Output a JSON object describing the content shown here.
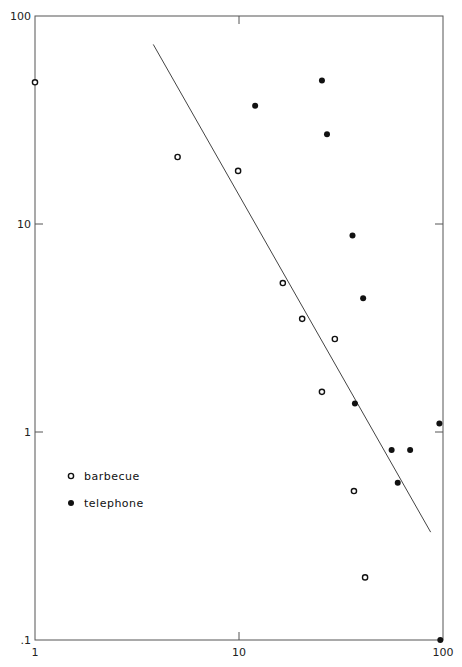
{
  "chart_data": {
    "type": "scatter",
    "title": "",
    "xlabel": "",
    "ylabel": "",
    "xscale": "log",
    "yscale": "log",
    "xlim": [
      1,
      100
    ],
    "ylim": [
      0.1,
      100
    ],
    "grid": false,
    "legend_position": "lower-left",
    "x_ticks": [
      "1",
      "10",
      "100"
    ],
    "y_ticks": [
      "100",
      "10",
      "1",
      ".1"
    ],
    "series": [
      {
        "name": "barbecue",
        "marker": "open-circle",
        "points": [
          {
            "x": 1,
            "y": 48
          },
          {
            "x": 5.0,
            "y": 21
          },
          {
            "x": 9.9,
            "y": 18
          },
          {
            "x": 16.4,
            "y": 5.2
          },
          {
            "x": 20.4,
            "y": 3.5
          },
          {
            "x": 29.5,
            "y": 2.8
          },
          {
            "x": 25.5,
            "y": 1.56
          },
          {
            "x": 36.6,
            "y": 0.52
          },
          {
            "x": 41.5,
            "y": 0.2
          }
        ]
      },
      {
        "name": "telephone",
        "marker": "filled-circle",
        "points": [
          {
            "x": 12,
            "y": 37
          },
          {
            "x": 25.5,
            "y": 49
          },
          {
            "x": 27,
            "y": 27
          },
          {
            "x": 36,
            "y": 8.8
          },
          {
            "x": 40.6,
            "y": 4.4
          },
          {
            "x": 37,
            "y": 1.37
          },
          {
            "x": 56,
            "y": 0.82
          },
          {
            "x": 69,
            "y": 0.82
          },
          {
            "x": 60,
            "y": 0.57
          },
          {
            "x": 96,
            "y": 1.1
          },
          {
            "x": 97,
            "y": 0.1
          }
        ]
      }
    ],
    "fit_line": {
      "x1": 3.8,
      "y1": 73,
      "x2": 87,
      "y2": 0.33
    },
    "legend": [
      {
        "label": "barbecue",
        "marker": "open-circle"
      },
      {
        "label": "telephone",
        "marker": "filled-circle"
      }
    ]
  },
  "axis": {
    "x_labels": [
      {
        "value": 1,
        "text": "1"
      },
      {
        "value": 10,
        "text": "10"
      },
      {
        "value": 100,
        "text": "100"
      }
    ],
    "y_labels": [
      {
        "value": 100,
        "text": "100"
      },
      {
        "value": 10,
        "text": "10"
      },
      {
        "value": 1,
        "text": "1"
      },
      {
        "value": 0.1,
        "text": ".1"
      }
    ]
  },
  "colors": {
    "ink": "#111111",
    "frame": "#555555",
    "background": "#ffffff"
  }
}
